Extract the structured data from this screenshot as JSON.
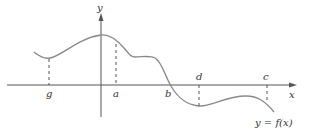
{
  "figure": {
    "axes": {
      "x_label": "x",
      "y_label": "y"
    },
    "curve_label": "y = f(x)",
    "points": [
      {
        "label": "g",
        "label_pos": "below",
        "kind": "local minimum"
      },
      {
        "label": "a",
        "label_pos": "below",
        "kind": "point right of y-axis"
      },
      {
        "label": "b",
        "label_pos": "below",
        "kind": "x-intercept"
      },
      {
        "label": "d",
        "label_pos": "above",
        "kind": "local minimum"
      },
      {
        "label": "c",
        "label_pos": "above",
        "kind": "point near right end"
      }
    ],
    "colors": {
      "curve": "#8a8a8a",
      "axes": "#555555",
      "text": "#333333",
      "background": "#ffffff"
    }
  }
}
